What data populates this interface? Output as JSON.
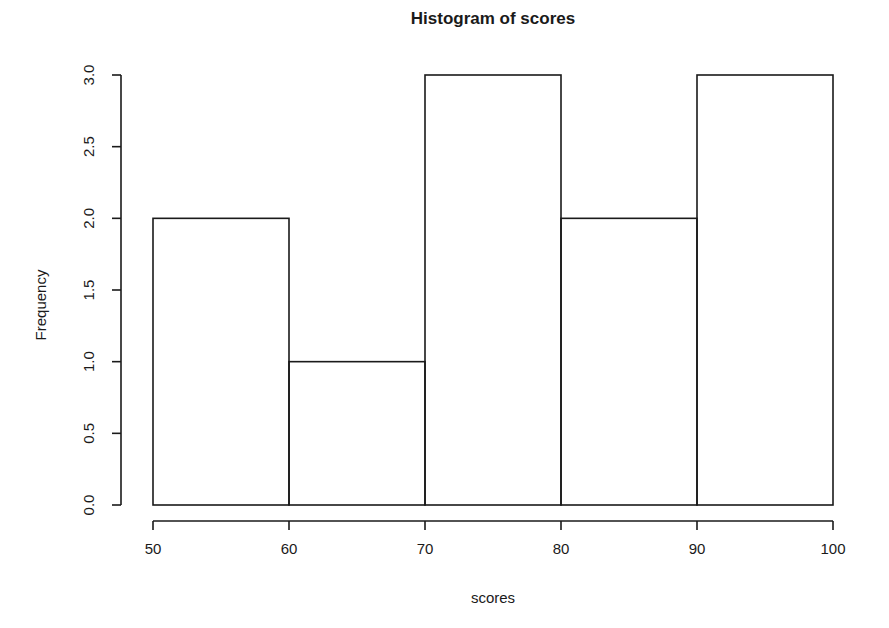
{
  "chart_data": {
    "type": "bar",
    "title": "Histogram of scores",
    "xlabel": "scores",
    "ylabel": "Frequency",
    "bin_edges": [
      50,
      60,
      70,
      80,
      90,
      100
    ],
    "categories": [
      "50-60",
      "60-70",
      "70-80",
      "80-90",
      "90-100"
    ],
    "values": [
      2,
      1,
      3,
      2,
      3
    ],
    "xlim": [
      50,
      100
    ],
    "ylim": [
      0,
      3
    ],
    "xticks": [
      50,
      60,
      70,
      80,
      90,
      100
    ],
    "xtick_labels": [
      "50",
      "60",
      "70",
      "80",
      "90",
      "100"
    ],
    "yticks": [
      0,
      0.5,
      1,
      1.5,
      2,
      2.5,
      3
    ],
    "ytick_labels": [
      "0.0",
      "0.5",
      "1.0",
      "1.5",
      "2.0",
      "2.5",
      "3.0"
    ],
    "grid": false,
    "legend": false,
    "bar_fill": "none",
    "bar_stroke": "#1a1a1a",
    "background": "#ffffff"
  },
  "figure": {
    "title": "Histogram of scores",
    "x_axis_title": "scores",
    "y_axis_title": "Frequency"
  }
}
